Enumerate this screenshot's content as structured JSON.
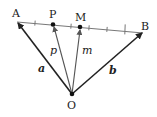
{
  "diagram": {
    "points": {
      "A": {
        "label": "A"
      },
      "B": {
        "label": "B"
      },
      "P": {
        "label": "P"
      },
      "M": {
        "label": "M"
      },
      "O": {
        "label": "O"
      }
    },
    "vectors": {
      "a": {
        "label": "a",
        "from": "O",
        "to": "A"
      },
      "b": {
        "label": "b",
        "from": "O",
        "to": "B"
      },
      "p": {
        "label": "p",
        "from": "O",
        "to": "P"
      },
      "m": {
        "label": "m",
        "from": "O",
        "to": "M"
      }
    },
    "segment_AB": {
      "divisions": 7,
      "P_position": "2/7 from A",
      "M_position": "midpoint"
    },
    "colors": {
      "stroke": "#222222",
      "segment": "#777777"
    }
  }
}
